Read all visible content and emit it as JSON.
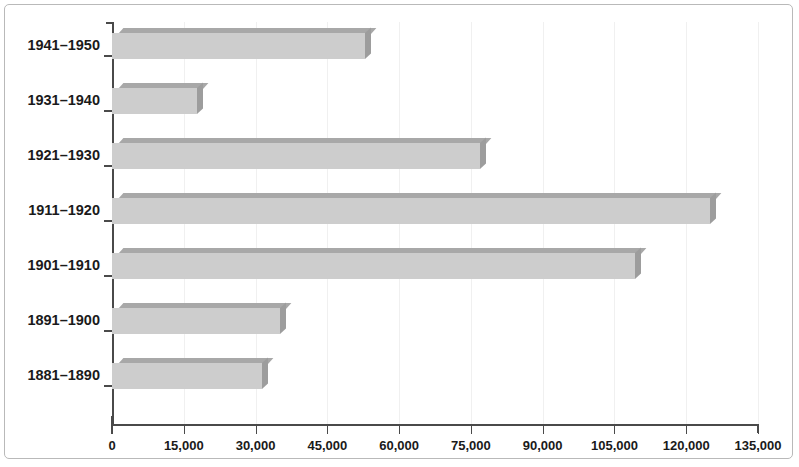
{
  "chart_data": {
    "type": "bar",
    "orientation": "horizontal",
    "title": "",
    "xlabel": "",
    "ylabel": "",
    "categories": [
      "1941–1950",
      "1931–1940",
      "1921–1930",
      "1911–1920",
      "1901–1910",
      "1891–1900",
      "1881–1890"
    ],
    "values": [
      52900,
      17800,
      76900,
      125000,
      109300,
      35100,
      31400
    ],
    "xlim": [
      0,
      135000
    ],
    "xticks": [
      0,
      15000,
      30000,
      45000,
      60000,
      75000,
      90000,
      105000,
      120000,
      135000
    ],
    "xtick_labels": [
      "0",
      "15,000",
      "30,000",
      "45,000",
      "60,000",
      "75,000",
      "90,000",
      "105,000",
      "120,000",
      "135,000"
    ],
    "grid": true,
    "legend": false,
    "bar_fill_color": "#cdcdcd",
    "bar_top_color": "#a8a8a8",
    "bar_side_color": "#9d9d9d",
    "axis_color": "#4a4a4a",
    "gridline_color": "#f0f0f0",
    "frame_color": "#b9b9b9"
  }
}
